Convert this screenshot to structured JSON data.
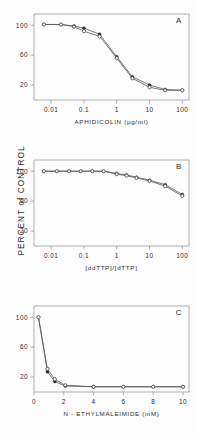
{
  "figure": {
    "shared_ylabel": "PERCENT  of  CONTROL",
    "background": "#fdfdfd"
  },
  "chart_data": [
    {
      "type": "line",
      "panel_label": "A",
      "title": "",
      "xlabel": "APHIDICOLIN  (µg/ml)",
      "ylabel": "PERCENT of CONTROL",
      "xscale": "log",
      "xlim": [
        0.003,
        160
      ],
      "ylim": [
        0,
        115
      ],
      "xticks": [
        0.01,
        0.1,
        1,
        10,
        100
      ],
      "xticklabels": [
        "0.01",
        "0.1",
        "1",
        "10",
        "100"
      ],
      "yticks": [
        20,
        60,
        100
      ],
      "yticklabels": [
        "20",
        "60",
        "100"
      ],
      "grid": false,
      "legend": "none",
      "series": [
        {
          "name": "closed-symbols",
          "marker": "filled",
          "x": [
            0.006,
            0.02,
            0.05,
            0.1,
            0.3,
            1,
            3,
            10,
            30,
            100
          ],
          "y": [
            101,
            101,
            99,
            96,
            88,
            58,
            31,
            20,
            14,
            13
          ]
        },
        {
          "name": "open-symbols",
          "marker": "open",
          "x": [
            0.006,
            0.02,
            0.05,
            0.1,
            0.3,
            1,
            3,
            10,
            30,
            100
          ],
          "y": [
            101,
            101,
            98,
            92,
            85,
            56,
            29,
            17,
            13,
            13
          ]
        }
      ]
    },
    {
      "type": "line",
      "panel_label": "B",
      "title": "",
      "xlabel": "[ddTTP]/[dTTP]",
      "ylabel": "PERCENT of CONTROL",
      "xscale": "log",
      "xlim": [
        0.003,
        160
      ],
      "ylim": [
        0,
        115
      ],
      "xticks": [
        0.01,
        0.1,
        1,
        10,
        100
      ],
      "xticklabels": [
        "0.01",
        "0.1",
        "1",
        "10",
        "100"
      ],
      "yticks": [
        20,
        60,
        100
      ],
      "yticklabels": [
        "20",
        "60",
        "100"
      ],
      "grid": false,
      "legend": "none",
      "series": [
        {
          "name": "closed-symbols",
          "marker": "filled",
          "x": [
            0.006,
            0.015,
            0.035,
            0.08,
            0.18,
            0.4,
            1,
            2,
            4,
            10,
            30,
            100
          ],
          "y": [
            100,
            100,
            100,
            100,
            100,
            100,
            97,
            95,
            92,
            88,
            82,
            69
          ]
        },
        {
          "name": "open-symbols",
          "marker": "open",
          "x": [
            0.006,
            0.015,
            0.035,
            0.08,
            0.18,
            0.4,
            1,
            2,
            4,
            10,
            30,
            100
          ],
          "y": [
            100,
            100,
            100,
            100,
            100,
            100,
            96,
            94,
            91,
            87,
            80,
            67
          ]
        }
      ]
    },
    {
      "type": "line",
      "panel_label": "C",
      "title": "",
      "xlabel": "N - ETHYLMALEIMIDE  (mM)",
      "ylabel": "PERCENT of CONTROL",
      "xscale": "linear",
      "xlim": [
        0,
        10.4
      ],
      "ylim": [
        0,
        115
      ],
      "xticks": [
        0,
        2,
        4,
        6,
        8,
        10
      ],
      "xticklabels": [
        "0",
        "2",
        "4",
        "6",
        "8",
        "10"
      ],
      "yticks": [
        20,
        60,
        100
      ],
      "yticklabels": [
        "20",
        "60",
        "100"
      ],
      "grid": false,
      "legend": "none",
      "series": [
        {
          "name": "closed-symbols",
          "marker": "filled",
          "x": [
            0.3,
            0.9,
            1.4,
            2.1,
            4,
            6,
            8,
            10
          ],
          "y": [
            100,
            27,
            14,
            8,
            7,
            7,
            7,
            7
          ]
        },
        {
          "name": "open-symbols",
          "marker": "open",
          "x": [
            0.3,
            0.9,
            1.4,
            2.1,
            4,
            6,
            8,
            10
          ],
          "y": [
            100,
            31,
            17,
            9,
            7,
            7,
            7,
            7
          ]
        }
      ]
    }
  ]
}
